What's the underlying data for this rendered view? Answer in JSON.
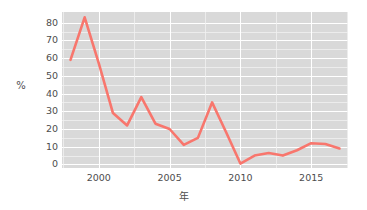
{
  "chart_data": {
    "type": "line",
    "title": "",
    "subtitle": "",
    "xlabel": "年",
    "ylabel": "%",
    "xlim": [
      1997.4,
      2017.6
    ],
    "ylim": [
      -2,
      86
    ],
    "grid": true,
    "legend": false,
    "legend_position": "none",
    "line_color": "#F8766D",
    "panel_color": "#D9D9D9",
    "gridline_color": "#FFFFFF",
    "text_color": "#4D4D4D",
    "x": [
      1998,
      1999,
      2000,
      2001,
      2002,
      2003,
      2004,
      2005,
      2006,
      2007,
      2008,
      2009,
      2010,
      2011,
      2012,
      2013,
      2014,
      2015,
      2016,
      2017
    ],
    "values": [
      59,
      83,
      57,
      29,
      22,
      38,
      23,
      20,
      11,
      15,
      35,
      18,
      0.5,
      5,
      6.5,
      5,
      8,
      12,
      11.5,
      9
    ],
    "series": [
      {
        "name": "%",
        "values": [
          59,
          83,
          57,
          29,
          22,
          38,
          23,
          20,
          11,
          15,
          35,
          18,
          0.5,
          5,
          6.5,
          5,
          8,
          12,
          11.5,
          9
        ]
      }
    ],
    "y_ticks": [
      0,
      10,
      20,
      30,
      40,
      50,
      60,
      70,
      80
    ],
    "y_tick_labels": [
      "0",
      "10",
      "20",
      "30",
      "40",
      "50",
      "60",
      "70",
      "80"
    ],
    "x_ticks": [
      2000,
      2005,
      2010,
      2015
    ],
    "x_tick_labels": [
      "2000",
      "2005",
      "2010",
      "2015"
    ],
    "y_minor_ticks": [
      5,
      15,
      25,
      35,
      45,
      55,
      65,
      75
    ],
    "x_minor_ticks": [
      1997.5,
      2002.5,
      2007.5,
      2012.5,
      2017.5
    ]
  }
}
